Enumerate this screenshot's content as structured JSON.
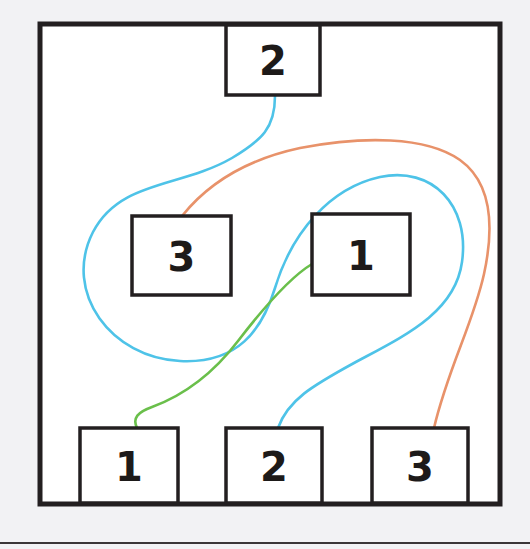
{
  "canvas": {
    "width": 530,
    "height": 549,
    "background_color": "#f2f2f4",
    "paper_color": "#ffffff"
  },
  "frame": {
    "name": "outer-frame",
    "x": 40,
    "y": 24,
    "width": 460,
    "height": 480,
    "stroke_color": "#231f20",
    "stroke_width": 5
  },
  "baseline_rule": {
    "name": "bottom-rule",
    "y": 543,
    "x1": 0,
    "x2": 530,
    "stroke_color": "#3a3637",
    "stroke_width": 2
  },
  "colors": {
    "box_stroke": "#231f20",
    "box_fill": "#ffffff",
    "label_text": "#1d1a19",
    "edge_cyan": "#4ec3e8",
    "edge_orange": "#e8926a",
    "edge_green": "#6abf4b"
  },
  "nodes": [
    {
      "id": "top-2",
      "name": "node-box-top-2",
      "label": "2",
      "row": "top",
      "x": 226,
      "y": 25,
      "width": 94,
      "height": 70
    },
    {
      "id": "mid-3",
      "name": "node-box-middle-3",
      "label": "3",
      "row": "middle",
      "x": 132,
      "y": 216,
      "width": 99,
      "height": 79
    },
    {
      "id": "mid-1",
      "name": "node-box-middle-1",
      "label": "1",
      "row": "middle",
      "x": 312,
      "y": 214,
      "width": 98,
      "height": 81
    },
    {
      "id": "bot-1",
      "name": "node-box-bottom-1",
      "label": "1",
      "row": "bottom",
      "x": 80,
      "y": 428,
      "width": 98,
      "height": 75
    },
    {
      "id": "bot-2",
      "name": "node-box-bottom-2",
      "label": "2",
      "row": "bottom",
      "x": 226,
      "y": 428,
      "width": 96,
      "height": 75
    },
    {
      "id": "bot-3",
      "name": "node-box-bottom-3",
      "label": "3",
      "row": "bottom",
      "x": 372,
      "y": 428,
      "width": 96,
      "height": 75
    }
  ],
  "edges": [
    {
      "id": "edge-cyan-top2-to-bot2",
      "name": "edge-cyan",
      "color_key": "edge_cyan",
      "color": "#4ec3e8",
      "from": "top-2",
      "to": "bot-2",
      "stroke_width": 2.6,
      "path": "M 275 96 C 275 128 262 140 232 158 C 180 188 120 180 93 232 C 62 293 112 358 180 361 C 238 364 262 330 275 288 C 292 232 330 188 380 177 C 432 166 470 205 462 262 C 455 313 404 336 354 363 C 312 386 288 400 278 428"
    },
    {
      "id": "edge-orange-mid3-to-bot3",
      "name": "edge-orange",
      "color_key": "edge_orange",
      "color": "#e8926a",
      "from": "mid-3",
      "to": "bot-3",
      "stroke_width": 2.6,
      "path": "M 182 216 C 206 186 244 160 300 148 C 362 136 426 136 460 160 C 492 183 494 228 484 274 C 473 324 448 368 434 428"
    },
    {
      "id": "edge-green-bot1-to-mid1",
      "name": "edge-green",
      "color_key": "edge_green",
      "color": "#6abf4b",
      "from": "bot-1",
      "to": "mid-1",
      "stroke_width": 2.6,
      "path": "M 137 428 C 132 418 138 412 152 407 C 182 396 212 375 238 341 C 268 302 292 276 312 264"
    }
  ]
}
